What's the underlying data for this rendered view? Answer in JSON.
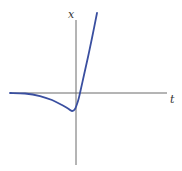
{
  "chart_data": {
    "type": "line",
    "title": "",
    "xlabel": "t",
    "ylabel": "x",
    "grid": false,
    "legend": null,
    "axes": {
      "color": "#6b6b6b",
      "t_axis": {
        "x1": 10,
        "x2": 167,
        "y": 93
      },
      "x_axis": {
        "x": 76,
        "y1": 20,
        "y2": 165
      }
    },
    "series": [
      {
        "name": "x(t)",
        "color": "#3a4fa0",
        "description": "Flat near zero for large negative t, dips to a minimum just left of t=0, then rises steeply and exits the top of the plot",
        "points_px": [
          [
            10,
            93
          ],
          [
            25,
            93.5
          ],
          [
            40,
            96
          ],
          [
            52,
            100
          ],
          [
            62,
            105
          ],
          [
            68,
            108.5
          ],
          [
            72,
            111
          ],
          [
            75,
            109
          ],
          [
            78,
            101
          ],
          [
            80,
            93
          ],
          [
            84,
            75
          ],
          [
            88,
            57
          ],
          [
            92,
            38
          ],
          [
            97,
            13
          ]
        ]
      }
    ],
    "annotations": [
      {
        "text": "x",
        "px": [
          68,
          18
        ]
      },
      {
        "text": "t",
        "px": [
          170,
          103
        ]
      }
    ]
  }
}
